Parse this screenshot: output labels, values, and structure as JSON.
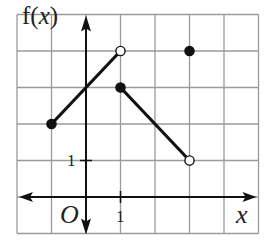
{
  "chart_data": {
    "type": "line",
    "title": "",
    "xlabel": "x",
    "ylabel": "f(x)",
    "origin_label": "O",
    "x_tick_label": "1",
    "y_tick_label": "1",
    "xlim": [
      -2,
      5
    ],
    "ylim": [
      -1,
      5
    ],
    "grid": true,
    "segments": [
      {
        "from": {
          "x": -1,
          "y": 2,
          "closed": true
        },
        "to": {
          "x": 1,
          "y": 4,
          "closed": false
        }
      },
      {
        "from": {
          "x": 1,
          "y": 3,
          "closed": true
        },
        "to": {
          "x": 3,
          "y": 1,
          "closed": false
        }
      }
    ],
    "isolated_points": [
      {
        "x": 3,
        "y": 4,
        "closed": true
      }
    ]
  },
  "colors": {
    "grid": "#9a9a9a",
    "ink": "#111111"
  }
}
